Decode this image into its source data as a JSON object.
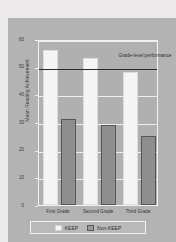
{
  "chart_data": {
    "type": "bar",
    "title": "",
    "xlabel": "",
    "ylabel": "Mean Reading Achievement",
    "ylim": [
      0,
      60
    ],
    "yticks": [
      0,
      10,
      20,
      30,
      40,
      50,
      60
    ],
    "grid": true,
    "legend_position": "bottom",
    "categories": [
      "First Grade",
      "Second Grade",
      "Third Grade"
    ],
    "series": [
      {
        "name": "KEEP",
        "values": [
          56,
          53,
          48
        ],
        "color": "#f4f4f4"
      },
      {
        "name": "Non-KEEP",
        "values": [
          31,
          29,
          25
        ],
        "color": "#8e8e8e"
      }
    ],
    "annotations": [
      {
        "text": "Grade-level performance",
        "y": 50,
        "type": "reference-line",
        "color": "#2b2b2b"
      }
    ]
  },
  "legend": {
    "items": [
      {
        "label": "KEEP"
      },
      {
        "label": "Non-KEEP"
      }
    ]
  },
  "axis": {
    "y_title": "Mean Reading Achievement",
    "y_tick_labels": [
      "0",
      "10",
      "20",
      "30",
      "40",
      "50",
      "60"
    ],
    "x_tick_labels": [
      "First Grade",
      "Second Grade",
      "Third Grade"
    ]
  },
  "annotation": {
    "grade_level": "Grade-level performance"
  }
}
